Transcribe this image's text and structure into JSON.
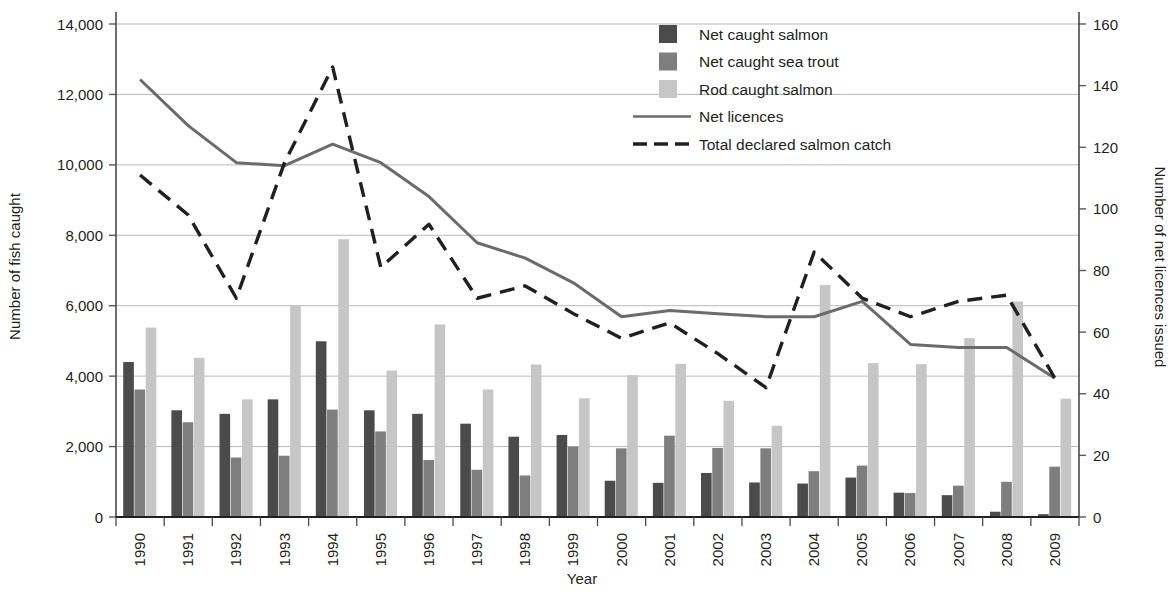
{
  "chart_data": {
    "type": "bar",
    "title": "",
    "xlabel": "Year",
    "ylabel": "Number of fish caught",
    "ylabel_secondary": "Number of net licences issued",
    "grid": true,
    "legend_position": "top-center",
    "ylim": [
      0,
      14000
    ],
    "ylim_secondary": [
      0,
      160
    ],
    "yticks": [
      "0",
      "2,000",
      "4,000",
      "6,000",
      "8,000",
      "10,000",
      "12,000",
      "14,000"
    ],
    "ytick_values": [
      0,
      2000,
      4000,
      6000,
      8000,
      10000,
      12000,
      14000
    ],
    "yticks_secondary": [
      "0",
      "20",
      "40",
      "60",
      "80",
      "100",
      "120",
      "140",
      "160"
    ],
    "ytick_values_secondary": [
      0,
      20,
      40,
      60,
      80,
      100,
      120,
      140,
      160
    ],
    "categories": [
      "1990",
      "1991",
      "1992",
      "1993",
      "1994",
      "1995",
      "1996",
      "1997",
      "1998",
      "1999",
      "2000",
      "2001",
      "2002",
      "2003",
      "2004",
      "2005",
      "2006",
      "2007",
      "2008",
      "2009"
    ],
    "series": [
      {
        "name": "Net caught salmon",
        "kind": "bar",
        "color": "#4b4b4b",
        "axis": "left",
        "values": [
          4400,
          3030,
          2930,
          3340,
          4990,
          3030,
          2930,
          2650,
          2280,
          2330,
          1030,
          970,
          1250,
          980,
          950,
          1120,
          690,
          620,
          150,
          80
        ]
      },
      {
        "name": "Net caught sea trout",
        "kind": "bar",
        "color": "#7e7e7e",
        "axis": "left",
        "values": [
          3620,
          2690,
          1690,
          1740,
          3050,
          2430,
          1620,
          1340,
          1180,
          2000,
          1950,
          2310,
          1960,
          1950,
          1300,
          1460,
          680,
          890,
          1000,
          1430
        ]
      },
      {
        "name": "Rod caught salmon",
        "kind": "bar",
        "color": "#c6c6c6",
        "axis": "left",
        "values": [
          5380,
          4520,
          3340,
          6010,
          7890,
          4160,
          5470,
          3620,
          4330,
          3370,
          4030,
          4350,
          3300,
          2590,
          6590,
          4370,
          4340,
          5080,
          6120,
          3360
        ]
      },
      {
        "name": "Net licences",
        "kind": "line",
        "style": "solid",
        "color": "#6b6b6b",
        "axis": "right",
        "values": [
          142,
          127,
          115,
          114,
          121,
          115,
          104,
          89,
          84,
          76,
          65,
          67,
          66,
          65,
          65,
          70,
          56,
          55,
          55,
          45
        ]
      },
      {
        "name": "Total declared salmon catch",
        "kind": "line",
        "style": "dashed",
        "color": "#231f20",
        "axis": "right",
        "values": [
          111,
          98,
          71,
          115,
          146,
          81,
          95,
          71,
          75,
          66,
          58,
          63,
          53,
          42,
          86,
          71,
          65,
          70,
          72,
          45
        ]
      }
    ],
    "legend": [
      {
        "label": "Net caught salmon",
        "marker": "swatch",
        "color": "#4b4b4b"
      },
      {
        "label": "Net caught sea trout",
        "marker": "swatch",
        "color": "#7e7e7e"
      },
      {
        "label": "Rod caught salmon",
        "marker": "swatch",
        "color": "#c6c6c6"
      },
      {
        "label": "Net licences",
        "marker": "line-solid",
        "color": "#6b6b6b"
      },
      {
        "label": "Total declared salmon catch",
        "marker": "line-dashed",
        "color": "#231f20"
      }
    ]
  }
}
